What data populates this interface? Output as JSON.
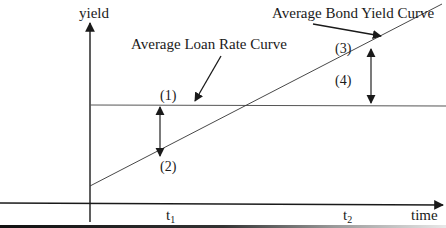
{
  "diagram": {
    "axes": {
      "y_label": "yield",
      "x_label": "time"
    },
    "ticks": {
      "t1": {
        "base": "t",
        "sub": "1"
      },
      "t2": {
        "base": "t",
        "sub": "2"
      }
    },
    "curves": {
      "loan": {
        "label": "Average Loan Rate Curve",
        "shape": "horizontal-line"
      },
      "bond": {
        "label": "Average Bond Yield Curve",
        "shape": "upward-sloping-line"
      }
    },
    "markers": {
      "m1": "(1)",
      "m2": "(2)",
      "m3": "(3)",
      "m4": "(4)"
    },
    "colors": {
      "line": "#1a1a1a",
      "thin_line": "#333333",
      "background": "#ffffff"
    }
  }
}
